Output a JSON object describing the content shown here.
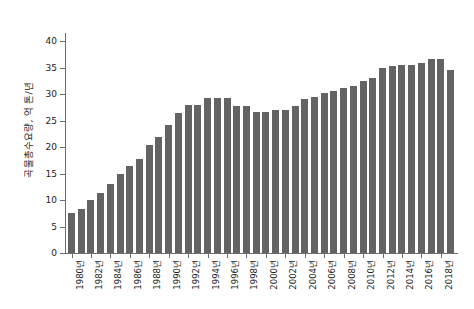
{
  "chart_data": {
    "type": "bar",
    "title": "",
    "subtitle": "",
    "xlabel": "",
    "ylabel": "곡물총수요량, 억 톤/년",
    "ylim": [
      0,
      40
    ],
    "yticks": [
      0,
      5,
      10,
      15,
      20,
      25,
      30,
      35,
      40
    ],
    "ytick_labels": [
      "0",
      "5",
      "10",
      "15",
      "20",
      "25",
      "30",
      "35",
      "40"
    ],
    "grid": false,
    "legend": "none",
    "bar_color": "#636363",
    "axis_color": "#6d6d6d",
    "xtick_labels": [
      "1980년",
      "1982년",
      "1984년",
      "1986년",
      "1988년",
      "1990년",
      "1992년",
      "1994년",
      "1996년",
      "1998년",
      "2000년",
      "2002년",
      "2004년",
      "2006년",
      "2008년",
      "2010년",
      "2012년",
      "2014년",
      "2016년",
      "2018년"
    ],
    "xtick_years": [
      1980,
      1982,
      1984,
      1986,
      1988,
      1990,
      1992,
      1994,
      1996,
      1998,
      2000,
      2002,
      2004,
      2006,
      2008,
      2010,
      2012,
      2014,
      2016,
      2018
    ],
    "categories": [
      "1980년",
      "1981년",
      "1982년",
      "1983년",
      "1984년",
      "1985년",
      "1986년",
      "1987년",
      "1988년",
      "1989년",
      "1990년",
      "1991년",
      "1992년",
      "1993년",
      "1994년",
      "1995년",
      "1996년",
      "1997년",
      "1998년",
      "1999년",
      "2000년",
      "2001년",
      "2002년",
      "2003년",
      "2004년",
      "2005년",
      "2006년",
      "2007년",
      "2008년",
      "2009년",
      "2010년",
      "2011년",
      "2012년",
      "2013년",
      "2014년",
      "2015년",
      "2016년",
      "2017년",
      "2018년",
      "2019년"
    ],
    "values": [
      7.5,
      8.3,
      10.0,
      11.3,
      13.0,
      15.0,
      16.5,
      17.7,
      20.3,
      21.8,
      24.2,
      26.5,
      28.0,
      28.0,
      29.3,
      29.3,
      29.3,
      27.7,
      27.7,
      26.6,
      26.6,
      27.0,
      27.0,
      27.8,
      29.0,
      29.5,
      30.2,
      30.6,
      31.2,
      31.6,
      32.5,
      33.1,
      35.0,
      35.3,
      35.5,
      35.5,
      35.9,
      36.6,
      36.6,
      34.6
    ]
  }
}
